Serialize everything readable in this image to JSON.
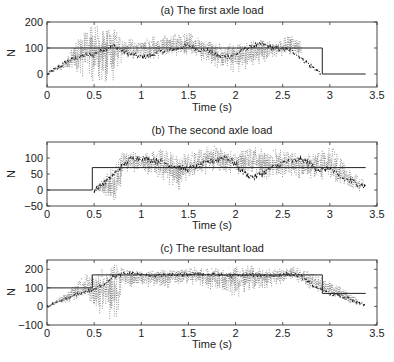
{
  "chart_data": [
    {
      "type": "line",
      "title": "(a) The first axle load",
      "xlabel": "Time (s)",
      "ylabel": "N",
      "xlim": [
        0,
        3.5
      ],
      "ylim": [
        -50,
        200
      ],
      "xticks": [
        0,
        0.5,
        1,
        1.5,
        2,
        2.5,
        3,
        3.5
      ],
      "xtick_labels": [
        "0",
        "0.5",
        "1",
        "1.5",
        "2",
        "2.5",
        "3",
        "3.5"
      ],
      "yticks": [
        0,
        100,
        200
      ],
      "ytick_labels": [
        "0",
        "100",
        "200"
      ],
      "grid": false,
      "series": [
        {
          "name": "static load (solid)",
          "style": "solid",
          "x": [
            0,
            2.92,
            2.92,
            3.38
          ],
          "y": [
            100,
            100,
            0,
            0
          ]
        },
        {
          "name": "identified load (dash-dot)",
          "style": "dashdot",
          "x": [
            0,
            0.1,
            0.2,
            0.3,
            0.4,
            0.5,
            0.6,
            0.7,
            0.8,
            0.9,
            1.0,
            1.1,
            1.2,
            1.3,
            1.4,
            1.5,
            1.6,
            1.7,
            1.8,
            1.9,
            2.0,
            2.1,
            2.2,
            2.3,
            2.4,
            2.5,
            2.6,
            2.7,
            2.8,
            2.9
          ],
          "y": [
            0,
            20,
            45,
            60,
            70,
            75,
            95,
            110,
            90,
            75,
            65,
            70,
            85,
            90,
            100,
            110,
            95,
            90,
            70,
            65,
            75,
            95,
            110,
            115,
            100,
            95,
            90,
            60,
            30,
            5
          ]
        },
        {
          "name": "measured load (dotted)",
          "style": "dotted",
          "x": [
            0,
            0.2,
            0.4,
            0.5,
            0.6,
            0.7,
            0.8,
            1.0,
            1.2,
            1.5,
            1.8,
            2.0,
            2.2,
            2.4,
            2.6,
            2.7
          ],
          "y_min": [
            0,
            20,
            -20,
            -30,
            -30,
            -30,
            60,
            40,
            60,
            70,
            20,
            0,
            20,
            60,
            70,
            60
          ],
          "y_max": [
            0,
            60,
            190,
            200,
            200,
            190,
            130,
            140,
            150,
            160,
            120,
            120,
            130,
            130,
            150,
            120
          ]
        }
      ]
    },
    {
      "type": "line",
      "title": "(b) The second axle load",
      "xlabel": "Time (s)",
      "ylabel": "N",
      "xlim": [
        0,
        3.5
      ],
      "ylim": [
        -50,
        150
      ],
      "xticks": [
        0,
        0.5,
        1,
        1.5,
        2,
        2.5,
        3,
        3.5
      ],
      "xtick_labels": [
        "0",
        "0.5",
        "1",
        "1.5",
        "2",
        "2.5",
        "3",
        "3.5"
      ],
      "yticks": [
        -50,
        0,
        50,
        100
      ],
      "ytick_labels": [
        "−50",
        "0",
        "50",
        "100"
      ],
      "grid": false,
      "series": [
        {
          "name": "static load (solid)",
          "style": "solid",
          "x": [
            0,
            0.48,
            0.48,
            3.38
          ],
          "y": [
            0,
            0,
            70,
            70
          ]
        },
        {
          "name": "identified load (dash-dot)",
          "style": "dashdot",
          "x": [
            0.5,
            0.6,
            0.7,
            0.8,
            0.9,
            1.0,
            1.1,
            1.2,
            1.3,
            1.4,
            1.5,
            1.6,
            1.7,
            1.8,
            1.9,
            2.0,
            2.1,
            2.2,
            2.3,
            2.4,
            2.5,
            2.6,
            2.7,
            2.8,
            2.9,
            3.0,
            3.1,
            3.2,
            3.3,
            3.38
          ],
          "y": [
            0,
            20,
            45,
            75,
            100,
            100,
            95,
            90,
            80,
            70,
            65,
            75,
            85,
            95,
            105,
            80,
            50,
            40,
            55,
            70,
            85,
            90,
            95,
            80,
            60,
            70,
            40,
            30,
            20,
            10
          ]
        },
        {
          "name": "measured load (dotted)",
          "style": "dotted",
          "x": [
            0.5,
            0.6,
            0.7,
            0.75,
            0.8,
            1.0,
            1.2,
            1.4,
            1.6,
            1.8,
            2.0,
            2.2,
            2.4,
            2.6,
            2.8,
            3.0,
            3.2,
            3.35
          ],
          "y_min": [
            0,
            -20,
            -45,
            -50,
            40,
            60,
            20,
            0,
            40,
            60,
            50,
            40,
            30,
            40,
            30,
            20,
            0,
            -10
          ],
          "y_max": [
            5,
            40,
            80,
            90,
            130,
            110,
            130,
            110,
            130,
            140,
            120,
            135,
            130,
            120,
            110,
            140,
            70,
            30
          ]
        }
      ]
    },
    {
      "type": "line",
      "title": "(c) The resultant load",
      "xlabel": "Time (s)",
      "ylabel": "N",
      "xlim": [
        0,
        3.5
      ],
      "ylim": [
        -100,
        250
      ],
      "xticks": [
        0,
        0.5,
        1,
        1.5,
        2,
        2.5,
        3,
        3.5
      ],
      "xtick_labels": [
        "0",
        "0.5",
        "1",
        "1.5",
        "2",
        "2.5",
        "3",
        "3.5"
      ],
      "yticks": [
        -100,
        0,
        100,
        200
      ],
      "ytick_labels": [
        "−100",
        "0",
        "100",
        "200"
      ],
      "grid": false,
      "series": [
        {
          "name": "static load (solid)",
          "style": "solid",
          "x": [
            0,
            0.48,
            0.48,
            2.92,
            2.92,
            3.38
          ],
          "y": [
            100,
            100,
            170,
            170,
            70,
            70
          ]
        },
        {
          "name": "identified load (dash-dot)",
          "style": "dashdot",
          "x": [
            0,
            0.1,
            0.2,
            0.3,
            0.4,
            0.5,
            0.6,
            0.7,
            0.8,
            0.9,
            1.0,
            1.2,
            1.4,
            1.6,
            1.8,
            2.0,
            2.2,
            2.4,
            2.6,
            2.7,
            2.8,
            2.9,
            3.0,
            3.1,
            3.2,
            3.3,
            3.38
          ],
          "y": [
            0,
            15,
            40,
            60,
            80,
            90,
            120,
            160,
            175,
            180,
            170,
            165,
            170,
            175,
            170,
            165,
            170,
            165,
            175,
            160,
            120,
            90,
            70,
            60,
            40,
            20,
            10
          ]
        },
        {
          "name": "measured load (dotted)",
          "style": "dotted",
          "x": [
            0,
            0.2,
            0.4,
            0.5,
            0.6,
            0.7,
            0.75,
            0.8,
            1.0,
            1.2,
            1.5,
            1.8,
            2.0,
            2.2,
            2.4,
            2.6,
            2.7,
            2.9,
            3.1,
            3.3
          ],
          "y_min": [
            0,
            20,
            20,
            -20,
            -60,
            -80,
            -100,
            100,
            110,
            90,
            120,
            80,
            40,
            70,
            110,
            130,
            110,
            70,
            30,
            0
          ],
          "y_max": [
            0,
            80,
            170,
            200,
            220,
            240,
            230,
            200,
            190,
            200,
            210,
            210,
            220,
            220,
            210,
            220,
            200,
            160,
            110,
            40
          ]
        }
      ]
    }
  ]
}
